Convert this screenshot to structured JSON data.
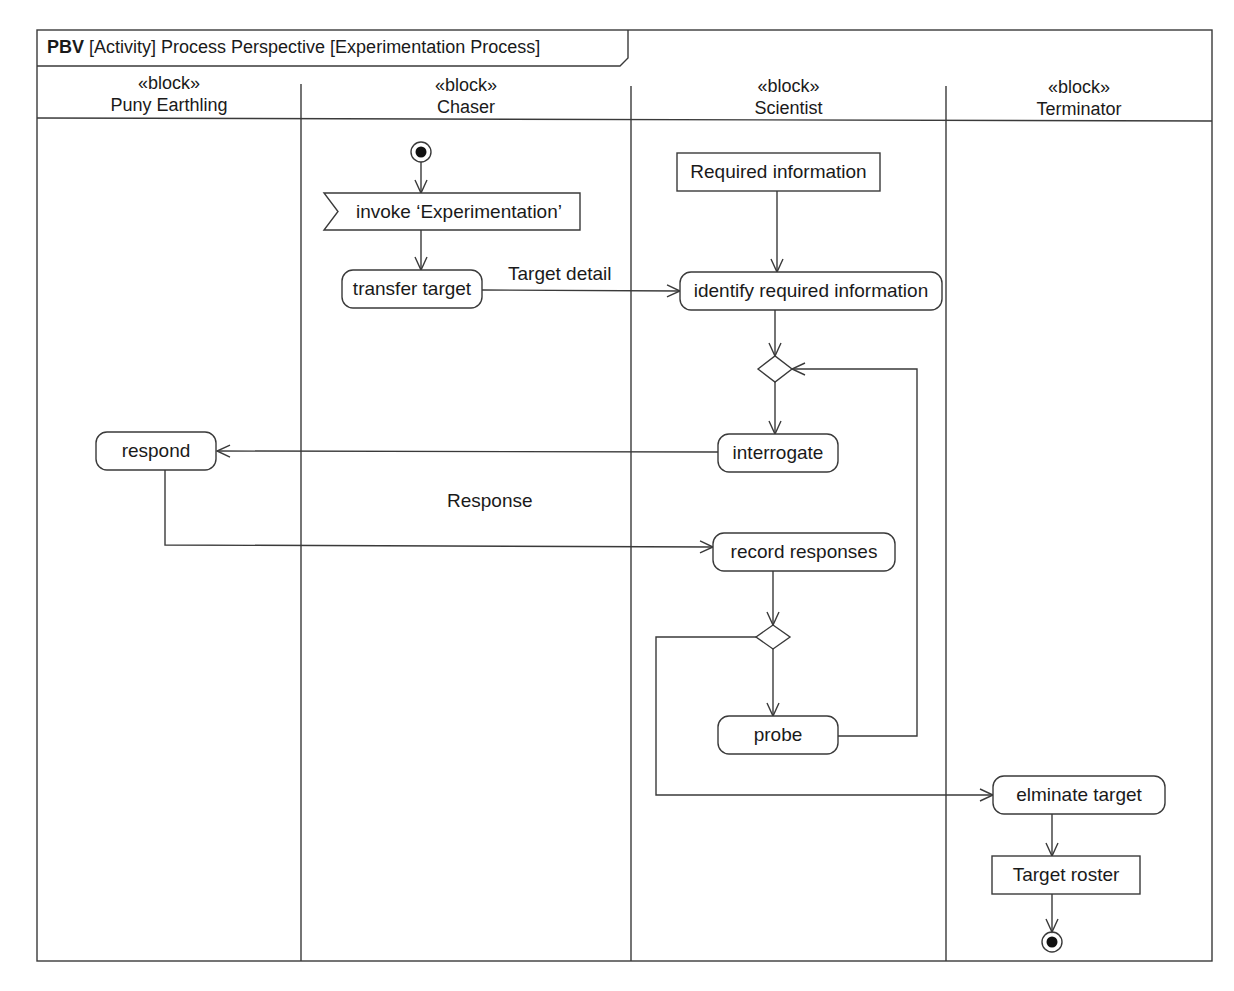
{
  "frame": {
    "kind": "PBV",
    "title": "[Activity] Process Perspective [Experimentation Process]"
  },
  "lanes": [
    {
      "stereotype": "«block»",
      "name": "Puny Earthling"
    },
    {
      "stereotype": "«block»",
      "name": "Chaser"
    },
    {
      "stereotype": "«block»",
      "name": "Scientist"
    },
    {
      "stereotype": "«block»",
      "name": "Terminator"
    }
  ],
  "nodes": {
    "invoke": "invoke ‘Experimentation’",
    "transfer_target": "transfer target",
    "required_information": "Required information",
    "identify_required_information": "identify required information",
    "interrogate": "interrogate",
    "respond": "respond",
    "record_responses": "record responses",
    "probe": "probe",
    "eliminate_target": "elminate target",
    "target_roster": "Target roster"
  },
  "edge_labels": {
    "target_detail": "Target detail",
    "response": "Response"
  },
  "colors": {
    "line": "#3a3a3a",
    "background": "#ffffff"
  }
}
